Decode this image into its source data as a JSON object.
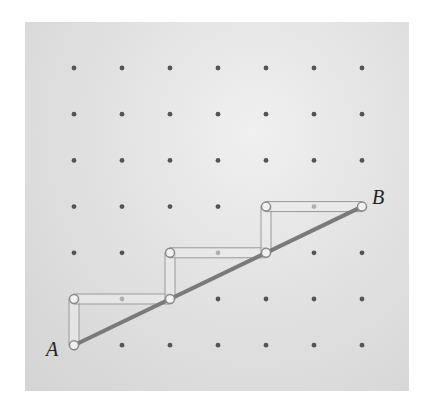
{
  "diagram": {
    "type": "geoboard-staircase",
    "grid": {
      "columns": 7,
      "rows": 7,
      "origin_x": 74,
      "origin_y": 68,
      "spacing_x": 48,
      "spacing_y": 46.2
    },
    "labels": {
      "start": "A",
      "end": "B"
    },
    "points": {
      "A": [
        0,
        6
      ],
      "B": [
        6,
        3
      ]
    },
    "staircase_path": [
      [
        0,
        6
      ],
      [
        0,
        5
      ],
      [
        2,
        5
      ],
      [
        2,
        4
      ],
      [
        4,
        4
      ],
      [
        4,
        3
      ],
      [
        6,
        3
      ]
    ],
    "diagonal": {
      "from": "A",
      "to": "B"
    },
    "colors": {
      "board": "#dcdcdc",
      "dot": "#555555",
      "diagonal": "#7a7a7a",
      "staircase": "#9a9a9a",
      "peg": "#f2f2f2"
    }
  }
}
